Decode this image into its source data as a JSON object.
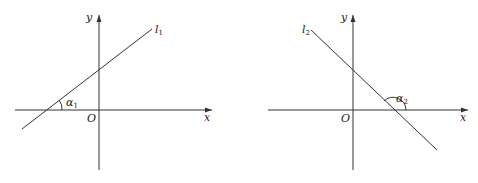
{
  "figures": [
    {
      "id": "left",
      "x_label": "x",
      "y_label": "y",
      "origin_label": "O",
      "line_label": "l",
      "line_subscript": "1",
      "angle_label": "α",
      "angle_subscript": "1",
      "slope_sign": "positive"
    },
    {
      "id": "right",
      "x_label": "x",
      "y_label": "y",
      "origin_label": "O",
      "line_label": "l",
      "line_subscript": "2",
      "angle_label": "α",
      "angle_subscript": "2",
      "slope_sign": "negative"
    }
  ],
  "colors": {
    "stroke": "#333333",
    "text": "#222222",
    "background": "#ffffff"
  }
}
